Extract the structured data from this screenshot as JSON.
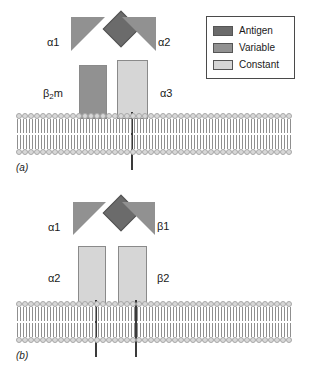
{
  "figure": {
    "background_color": "#ffffff",
    "colors": {
      "antigen": "#6b6b6b",
      "variable": "#919191",
      "constant": "#d6d6d6",
      "stalk": "#3a3a3a",
      "lipid_head": "#d8d8d8",
      "lipid_tail": "#8f8f8f",
      "outline": "#8a8a8a",
      "legend_border": "#4a4a4a"
    }
  },
  "legend": {
    "items": [
      {
        "label": "Antigen",
        "color": "#6b6b6b"
      },
      {
        "label": "Variable",
        "color": "#919191"
      },
      {
        "label": "Constant",
        "color": "#d6d6d6"
      }
    ]
  },
  "panels": [
    {
      "id": "a",
      "caption": "(a)",
      "antigen": {
        "name": "antigen",
        "shade": "antigen"
      },
      "domains": [
        {
          "label": "α1",
          "shape": "wedge",
          "side": "left",
          "shade": "variable"
        },
        {
          "label": "α2",
          "shape": "wedge",
          "side": "right",
          "shade": "variable"
        },
        {
          "label": "β₂m",
          "label_base": "β",
          "label_sub": "2",
          "label_tail": "m",
          "shape": "box",
          "side": "left",
          "shade": "variable"
        },
        {
          "label": "α3",
          "shape": "box",
          "side": "right",
          "shade": "constant"
        }
      ],
      "stalk_count": 1,
      "lipid_count": 46
    },
    {
      "id": "b",
      "caption": "(b)",
      "antigen": {
        "name": "antigen",
        "shade": "antigen"
      },
      "domains": [
        {
          "label": "α1",
          "shape": "wedge",
          "side": "left",
          "shade": "variable"
        },
        {
          "label": "β1",
          "shape": "wedge",
          "side": "right",
          "shade": "variable"
        },
        {
          "label": "α2",
          "shape": "box",
          "side": "left",
          "shade": "constant"
        },
        {
          "label": "β2",
          "shape": "box",
          "side": "right",
          "shade": "constant"
        }
      ],
      "stalk_count": 2,
      "lipid_count": 46
    }
  ]
}
